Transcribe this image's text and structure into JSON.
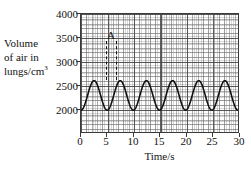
{
  "chart_data": {
    "type": "line",
    "title": "",
    "subtitle": "",
    "xlabel": "Time/s",
    "ylabel": "Volume of air in lungs/cm",
    "ylabel_lines": [
      "Volume",
      "of air in",
      "lungs/cm"
    ],
    "ylabel_superscript": "3",
    "xlabel_ticks": [
      "0",
      "5",
      "10",
      "15",
      "20",
      "25",
      "30"
    ],
    "xtick_values": [
      0,
      5,
      10,
      15,
      20,
      25,
      30
    ],
    "ylabel_ticks": [
      "2000",
      "2500",
      "3000",
      "3500",
      "4000"
    ],
    "ytick_values": [
      2000,
      2500,
      3000,
      3500,
      4000
    ],
    "xlim": [
      0,
      30
    ],
    "ylim": [
      2000,
      4000
    ],
    "grid": true,
    "grid_style": "fine graph paper, minor every 0.2 s / 20 cm3",
    "legend": "none",
    "line_color": "#111111",
    "series": [
      {
        "name": "breathing trace",
        "waveform": "sinusoidal",
        "baseline": 2620,
        "amplitude": 250,
        "peak_value": 2870,
        "trough_value": 2370,
        "period_seconds": 5,
        "first_peak_time": 2.5,
        "x": [
          0,
          1.25,
          2.5,
          3.75,
          5,
          6.25,
          7.5,
          8.75,
          10,
          11.25,
          12.5,
          13.75,
          15,
          16.25,
          17.5,
          18.75,
          20,
          21.25,
          22.5,
          23.75,
          25,
          26.25,
          27.5,
          28.75,
          30
        ],
        "y": [
          2370,
          2620,
          2870,
          2620,
          2370,
          2620,
          2870,
          2620,
          2370,
          2620,
          2870,
          2620,
          2370,
          2620,
          2870,
          2620,
          2370,
          2620,
          2870,
          2620,
          2370,
          2620,
          2870,
          2620,
          2370
        ]
      }
    ],
    "annotations": [
      {
        "label": "A",
        "type": "dashed-interval-marker",
        "x_start": 5.7,
        "x_end": 7.4,
        "y_top": 3250,
        "y_bottom": 2800,
        "description": "dashed vertical lines with letter A above"
      }
    ]
  }
}
